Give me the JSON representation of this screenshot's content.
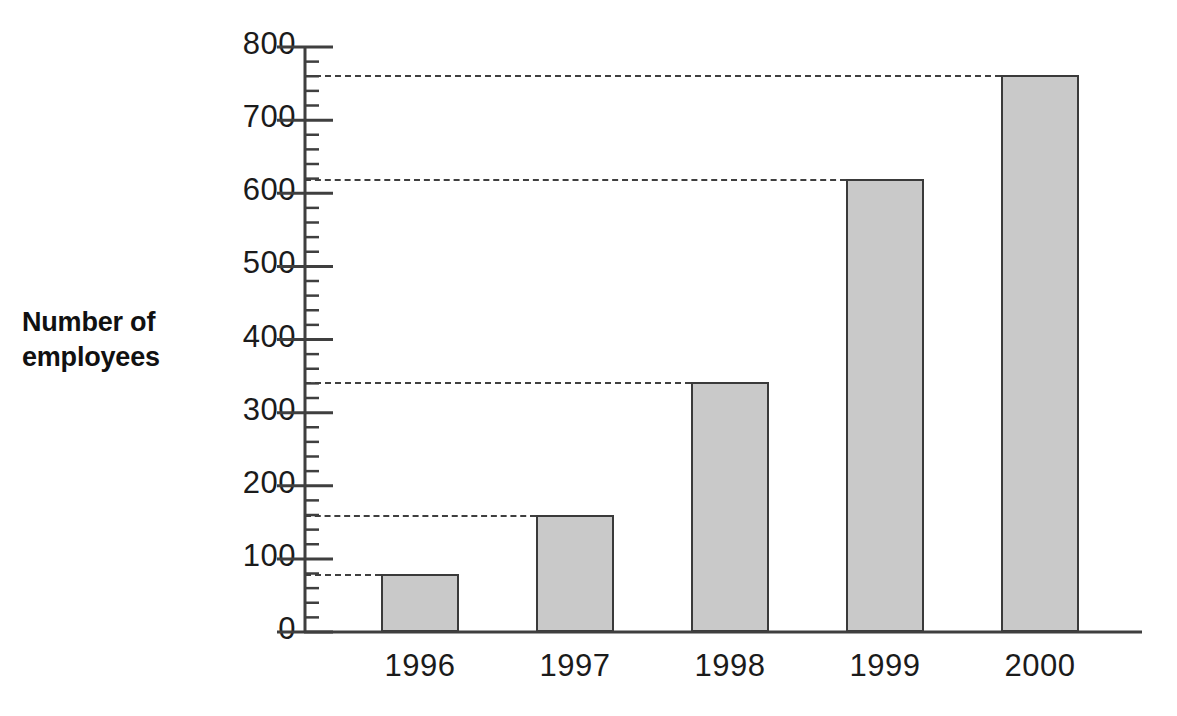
{
  "chart_data": {
    "type": "bar",
    "title": "",
    "subtitle": "",
    "xlabel": "",
    "ylabel": "Number of employees",
    "categories": [
      "1996",
      "1997",
      "1998",
      "1999",
      "2000"
    ],
    "values": [
      80,
      160,
      342,
      620,
      762
    ],
    "series": [
      {
        "name": "Number of employees",
        "values": [
          80,
          160,
          342,
          620,
          762
        ]
      }
    ],
    "ylim": [
      0,
      800
    ],
    "ytick_labels": [
      "0",
      "100",
      "200",
      "300",
      "400",
      "500",
      "600",
      "700",
      "800"
    ],
    "ytick_values": [
      0,
      100,
      200,
      300,
      400,
      500,
      600,
      700,
      800
    ],
    "yminor_tick_interval": 20,
    "grid": "dashed horizontal leader lines from y-axis to the top of each bar",
    "gridline_values": [
      80,
      160,
      342,
      620,
      762
    ],
    "legend": [],
    "legend_position": "none",
    "annotations": [],
    "bar_fill_color": "#c9c9c9",
    "bar_outline_color": "#3a3a3a",
    "axis_color": "#3f3f3f",
    "background_color": "#ffffff"
  },
  "axis_title_lines": [
    "Number of",
    "employees"
  ]
}
